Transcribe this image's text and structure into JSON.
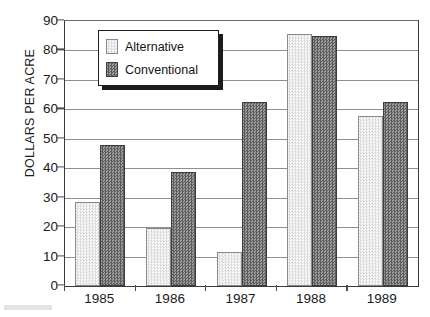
{
  "chart_data": {
    "type": "bar",
    "title": "",
    "xlabel": "",
    "ylabel": "DOLLARS PER ACRE",
    "categories": [
      "1985",
      "1986",
      "1987",
      "1988",
      "1989"
    ],
    "series": [
      {
        "name": "Alternative",
        "values": [
          28.7,
          19.8,
          11.7,
          85.7,
          57.7
        ],
        "color": "#e9e9e9"
      },
      {
        "name": "Conventional",
        "values": [
          48.0,
          38.7,
          62.5,
          84.8,
          62.5
        ],
        "color": "#767676"
      }
    ],
    "ylim": [
      0,
      90
    ],
    "yticks": [
      0,
      10,
      20,
      30,
      40,
      50,
      60,
      70,
      80,
      90
    ],
    "ytick_labels": [
      "0",
      "10",
      "20",
      "30",
      "40",
      "50",
      "60",
      "70",
      "80",
      "90"
    ],
    "grid": true,
    "legend_position": "upper-left"
  },
  "legend": {
    "items": [
      {
        "label": "Alternative",
        "swatch": "light-checker-swatch"
      },
      {
        "label": "Conventional",
        "swatch": "dark-checker-swatch"
      }
    ]
  },
  "axes": {
    "y_title": "DOLLARS PER ACRE"
  }
}
